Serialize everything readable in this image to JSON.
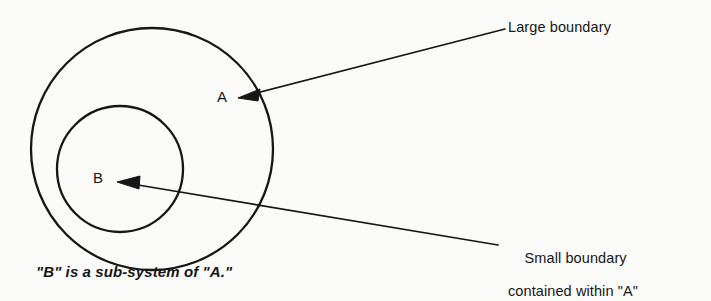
{
  "figure": {
    "type": "venn-containment-diagram",
    "background_color": "#fbfbfa",
    "ink_color": "#161616",
    "shapes": {
      "large_boundary": {
        "label": "A",
        "center_x": 152,
        "center_y": 149,
        "radius": 121
      },
      "small_boundary": {
        "label": "B",
        "center_x": 120,
        "center_y": 169,
        "radius": 63
      }
    }
  },
  "labels": {
    "large_circle_label": "A",
    "small_circle_label": "B"
  },
  "callouts": {
    "large_boundary": {
      "text": "Large boundary",
      "arrow_from_x": 505,
      "arrow_from_y": 29,
      "arrow_to_x": 239,
      "arrow_to_y": 98
    },
    "small_boundary": {
      "line1": "Small boundary",
      "line2": "contained within \"A\"",
      "arrow_from_x": 498,
      "arrow_from_y": 245,
      "arrow_to_x": 118,
      "arrow_to_y": 182
    }
  },
  "caption": {
    "text": "\"B\" is a sub-system of \"A.\""
  }
}
